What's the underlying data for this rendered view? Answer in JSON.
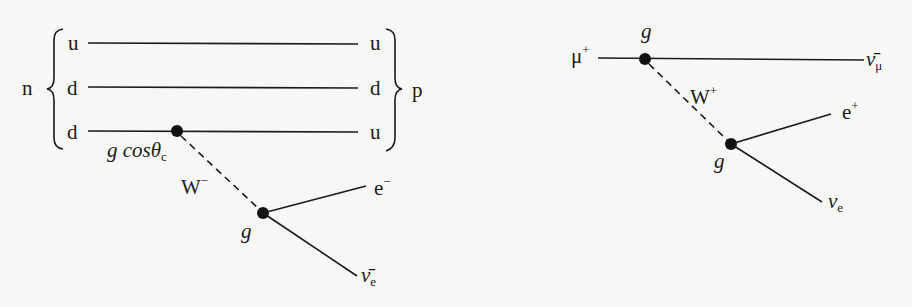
{
  "diagrams": [
    {
      "id": "neutron-beta-decay",
      "initial_label": "n",
      "final_label": "p",
      "quarks_in": [
        "u",
        "d",
        "d"
      ],
      "quarks_out": [
        "u",
        "d",
        "u"
      ],
      "vertex1_coupling": "g cos",
      "vertex1_theta": "θ",
      "vertex1_sub": "c",
      "boson": "W",
      "boson_charge": "−",
      "vertex2_coupling": "g",
      "lepton1": "e",
      "lepton1_charge": "−",
      "lepton2_bar": "ν̄",
      "lepton2_sub": "e"
    },
    {
      "id": "muon-decay",
      "initial": "μ",
      "initial_charge": "+",
      "final": "ν̄",
      "final_sub": "μ",
      "vertex1_coupling": "g",
      "boson": "W",
      "boson_charge": "+",
      "vertex2_coupling": "g",
      "lepton1": "e",
      "lepton1_charge": "+",
      "lepton2": "ν",
      "lepton2_sub": "e"
    }
  ]
}
